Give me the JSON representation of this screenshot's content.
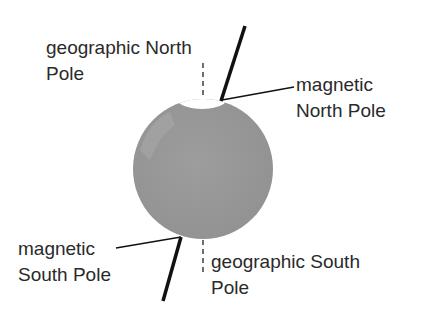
{
  "diagram": {
    "labels": {
      "geo_north_1": "geographic North",
      "geo_north_2": "Pole",
      "mag_north_1": "magnetic",
      "mag_north_2": "North Pole",
      "mag_south_1": "magnetic",
      "mag_south_2": "South Pole",
      "geo_south_1": "geographic South",
      "geo_south_2": "Pole"
    },
    "colors": {
      "globe": "#9a9a9a",
      "ice": "#ffffff",
      "axis": "#111111",
      "text": "#2a2a2a"
    }
  }
}
